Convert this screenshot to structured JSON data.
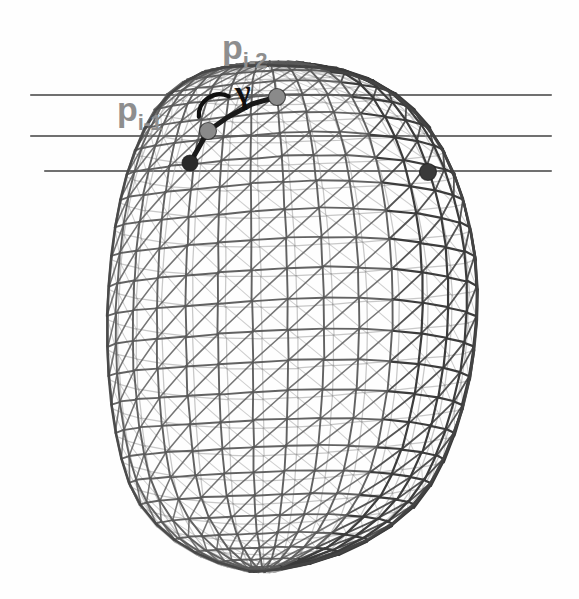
{
  "figure": {
    "background_color": "#fefefe",
    "width": 579,
    "height": 599
  },
  "labels": [
    {
      "id": "p_i_minus_2",
      "base": "p",
      "sub": "i-2",
      "x": 222,
      "y": 30,
      "color": "#8e8e8e"
    },
    {
      "id": "p_i_minus_1",
      "base": "p",
      "sub": "i-1",
      "x": 117,
      "y": 92,
      "color": "#8e8e8e"
    }
  ],
  "annotations": {
    "gamma_symbol": {
      "name": "gamma",
      "glyph": "γ",
      "x": 243,
      "y": 92,
      "color": "#101010"
    },
    "angle_arc": {
      "name": "angle-arc",
      "cx": 214,
      "cy": 106,
      "r": 21,
      "color": "#101010"
    }
  },
  "scan_lines": {
    "color": "#707070",
    "lines": [
      {
        "id": "scan-line-top",
        "x1": 31,
        "y1": 95,
        "x2": 551,
        "y2": 95
      },
      {
        "id": "scan-line-middle",
        "x1": 31,
        "y1": 136,
        "x2": 551,
        "y2": 136
      },
      {
        "id": "scan-line-bottom",
        "x1": 45,
        "y1": 171,
        "x2": 551,
        "y2": 171
      }
    ]
  },
  "marked_points": [
    {
      "id": "point-dark-left",
      "cx": 190,
      "cy": 163,
      "r": 8.0,
      "color": "#2a2a2a",
      "shade": "dark"
    },
    {
      "id": "point-gray-mid",
      "cx": 208,
      "cy": 131,
      "r": 8.5,
      "color": "#8a8a8a",
      "shade": "gray"
    },
    {
      "id": "point-gray-top",
      "cx": 277,
      "cy": 97,
      "r": 8.5,
      "color": "#8a8a8a",
      "shade": "gray"
    },
    {
      "id": "point-dark-right",
      "cx": 428,
      "cy": 172,
      "r": 8.5,
      "color": "#3a3a3a",
      "shade": "dark"
    }
  ],
  "polyline": {
    "id": "contour-polyline",
    "color": "#1a1a1a",
    "width": 5,
    "points": [
      [
        190,
        163
      ],
      [
        208,
        131
      ],
      [
        228,
        117
      ],
      [
        252,
        104
      ],
      [
        277,
        97
      ]
    ]
  },
  "mesh": {
    "name": "triangulated-surface-mesh",
    "edge_color": "#5a5a5a",
    "edge_color_light": "#9a9a9a",
    "silhouette_color": "#454545",
    "u_segments": 30,
    "v_segments": 26,
    "center_x": 268,
    "center_y": 318,
    "radius_x": 182,
    "radius_y": 253,
    "description": "Ellipsoidal blob, wider at top, tapering and flattened toward the bottom-right; dense triangulated wireframe with quad grid plus diagonals; dark crowded band along the right limb."
  },
  "chart_data": {
    "type": "scatter",
    "xlabel": "",
    "ylabel": "",
    "series": [
      {
        "name": "contour points",
        "labels": [
          "p_i-2",
          "p_i-1"
        ],
        "x": [
          277,
          190
        ],
        "y": [
          97,
          163
        ]
      }
    ]
  }
}
